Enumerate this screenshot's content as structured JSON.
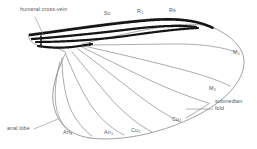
{
  "figure": {
    "kind": "insect-wing-venation-diagram",
    "background_color": "#ffffff",
    "line_color": "#6b6b6e",
    "heavy_vein_color": "#1a1a1a",
    "label_color": "#59595b"
  },
  "labels": {
    "humeral_cross_vein": "humeral cross-vein",
    "sc": "Sc",
    "r1_base": "R",
    "r1_sub": "1",
    "rs": "Rs",
    "m1_base": "M",
    "m1_sub": "1",
    "m2_base": "M",
    "m2_sub": "2",
    "submedian": "submedian",
    "fold": "fold",
    "cu1_base": "Cu",
    "cu1_sub": "1",
    "cu2_base": "Cu",
    "cu2_sub": "2",
    "an1_base": "An",
    "an1_sub": "1",
    "an2_base": "An",
    "an2_sub": "2",
    "anal_lobe": "anal lobe"
  }
}
